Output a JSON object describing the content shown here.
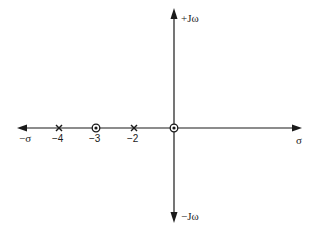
{
  "diagram": {
    "type": "s-plane pole-zero plot",
    "axes": {
      "real_positive_label": "σ",
      "real_negative_label": "−σ",
      "imag_positive_label": "+Jω",
      "imag_negative_label": "−Jω"
    },
    "poles": [
      {
        "value": -4,
        "label": "−4",
        "symbol": "cross"
      },
      {
        "value": -2,
        "label": "−2",
        "symbol": "cross"
      }
    ],
    "zeros": [
      {
        "value": -3,
        "label": "−3",
        "symbol": "circle"
      },
      {
        "value": 0,
        "label": "",
        "symbol": "circle"
      }
    ],
    "colors": {
      "line": "#1a1a1a",
      "background": "#ffffff"
    }
  }
}
